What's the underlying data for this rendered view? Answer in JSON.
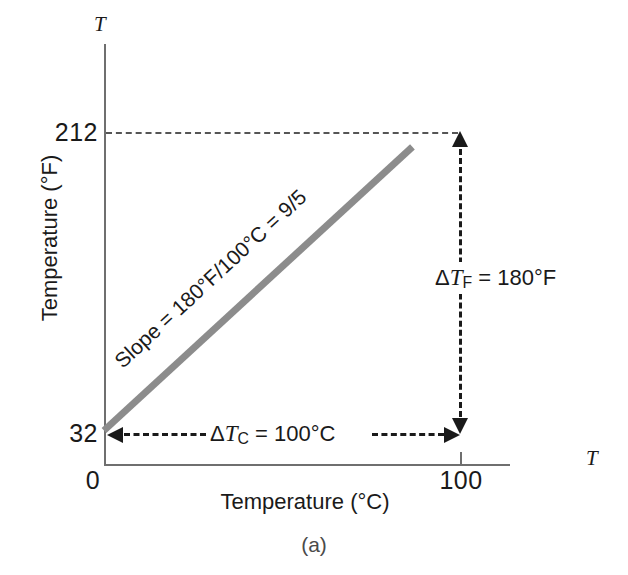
{
  "figure": {
    "caption": "(a)",
    "background_color": "#ffffff",
    "line_color": "#8c8c8c",
    "axis_color": "#6f6f6f",
    "text_color": "#1a1a1a"
  },
  "axes": {
    "y_title": "Temperature (°F)",
    "x_title": "Temperature (°C)",
    "y_variable": "T",
    "x_variable": "T",
    "y_ticks": [
      "212",
      "32"
    ],
    "x_ticks": [
      "0",
      "100"
    ]
  },
  "annotations": {
    "slope_prefix": "Slope = 180°F/100°C = 9/5",
    "delta_tf_delta": "Δ",
    "delta_tf_var": "T",
    "delta_tf_sub": "F",
    "delta_tf_value": " = 180°F",
    "delta_tc_delta": "Δ",
    "delta_tc_var": "T",
    "delta_tc_sub": "C",
    "delta_tc_value": " = 100°C"
  },
  "chart_data": {
    "type": "line",
    "title": "",
    "subtitle": "(a)",
    "xlabel": "Temperature (°C)",
    "ylabel": "Temperature (°F)",
    "x": [
      0,
      100
    ],
    "y": [
      32,
      212
    ],
    "series": [
      {
        "name": "Celsius to Fahrenheit conversion",
        "x": [
          0,
          100
        ],
        "values": [
          32,
          212
        ],
        "color": "#8c8c8c",
        "slope": 1.8,
        "intercept": 32
      }
    ],
    "xlim": [
      0,
      120
    ],
    "ylim": [
      0,
      260
    ],
    "xticks": [
      0,
      100
    ],
    "xticklabels": [
      "0",
      "100"
    ],
    "yticks": [
      32,
      212
    ],
    "yticklabels": [
      "32",
      "212"
    ],
    "grid": false,
    "legend": null,
    "annotations": [
      "Slope = 180°F/100°C = 9/5",
      "ΔT_F = 180°F",
      "ΔT_C = 100°C"
    ]
  }
}
